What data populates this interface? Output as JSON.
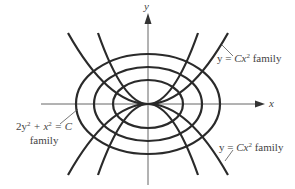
{
  "diagram": {
    "title": "",
    "axes": {
      "x_label": "x",
      "y_label": "y",
      "origin_px": [
        148,
        104
      ]
    },
    "families": [
      {
        "name": "ellipse-family",
        "equation": "2y² + x² = C",
        "label_line1_prefix": "2y",
        "label_line1_mid": " + x",
        "label_line1_suffix": " = C",
        "label_line2": "family",
        "curves": [
          {
            "rx": 72,
            "ry": 50
          },
          {
            "rx": 54,
            "ry": 37
          },
          {
            "rx": 35,
            "ry": 24
          }
        ]
      },
      {
        "name": "parabola-family",
        "equation": "y = Cx²",
        "label_prefix": "y = ",
        "label_var": "Cx",
        "label_exp": "2",
        "label_suffix": " family",
        "curves": [
          {
            "half_width_px": 80,
            "direction": "up"
          },
          {
            "half_width_px": 50,
            "direction": "up"
          },
          {
            "half_width_px": 80,
            "direction": "down"
          },
          {
            "half_width_px": 50,
            "direction": "down"
          }
        ]
      }
    ],
    "annotations": [
      {
        "text": "y = Cx² family",
        "position": "upper-right"
      },
      {
        "text": "y = Cx² family",
        "position": "lower-right"
      },
      {
        "text": "2y² + x² = C family",
        "position": "left"
      }
    ],
    "colors": {
      "curve": "#2a2a2a",
      "axis": "#555555",
      "text": "#444444"
    }
  }
}
